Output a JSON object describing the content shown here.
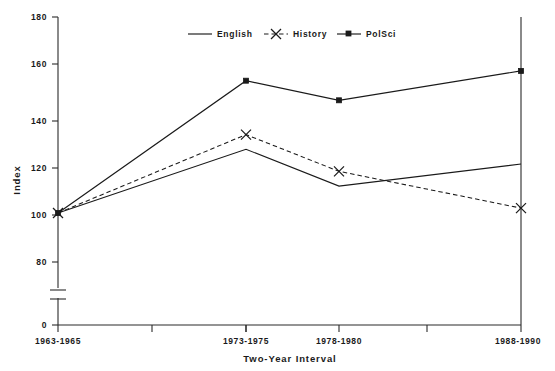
{
  "chart_data": {
    "type": "line",
    "title": "",
    "xlabel": "Two-Year Interval",
    "ylabel": "Index",
    "categories": [
      "1963-1965",
      "1973-1975",
      "1978-1980",
      "1988-1990"
    ],
    "series": [
      {
        "name": "English",
        "values": [
          100,
          126,
          111,
          120
        ],
        "style": "solid",
        "marker": "none"
      },
      {
        "name": "History",
        "values": [
          100,
          132,
          117,
          102
        ],
        "style": "dashed",
        "marker": "x"
      },
      {
        "name": "PolSci",
        "values": [
          100,
          154,
          146,
          158
        ],
        "style": "solid",
        "marker": "square"
      }
    ],
    "ylim": [
      0,
      180
    ],
    "yticks": [
      0,
      80,
      100,
      120,
      140,
      160,
      180
    ],
    "ytick_labels": [
      "0",
      "80",
      "100",
      "120",
      "140",
      "160",
      "180"
    ],
    "y_axis_break": true,
    "y_axis_break_between": [
      0,
      80
    ],
    "grid": false,
    "legend_position": "top-center",
    "legend_entries": [
      "English",
      "History",
      "PolSci"
    ]
  },
  "axes": {
    "y_title": "Index",
    "x_title": "Two-Year Interval",
    "y_labels": [
      "180",
      "160",
      "140",
      "120",
      "100",
      "80",
      "0"
    ],
    "x_labels": [
      "1963-1965",
      "1973-1975",
      "1978-1980",
      "1988-1990"
    ]
  },
  "legend": {
    "items": [
      {
        "label": "English"
      },
      {
        "label": "History"
      },
      {
        "label": "PolSci"
      }
    ]
  },
  "colors": {
    "ink": "#1a1a1a",
    "axis": "#2a2a2a",
    "background": "#ffffff"
  }
}
